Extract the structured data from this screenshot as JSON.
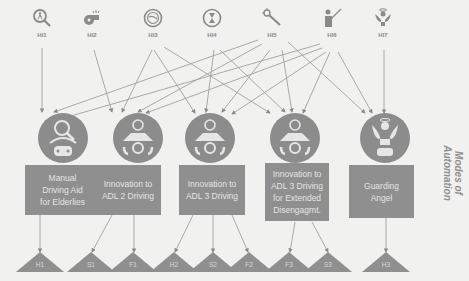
{
  "colors": {
    "background": "#f1f1ef",
    "node_fill": "#8c8c8c",
    "box_fill": "#8f8f8f",
    "box_text": "#e4e4e4",
    "line": "#9a9a9a",
    "label": "#8a8a8a"
  },
  "human_inputs": [
    {
      "id": "HI1",
      "label": "HI1",
      "icon": "magnifier-person-icon"
    },
    {
      "id": "HI2",
      "label": "HI2",
      "icon": "whistle-icon"
    },
    {
      "id": "HI3",
      "label": "HI3",
      "icon": "clock-face-icon"
    },
    {
      "id": "HI4",
      "label": "HI4",
      "icon": "hourglass-icon"
    },
    {
      "id": "HI5",
      "label": "HI5",
      "icon": "magic-wand-icon"
    },
    {
      "id": "HI6",
      "label": "HI6",
      "icon": "teacher-pointer-icon"
    },
    {
      "id": "HI7",
      "label": "HI7",
      "icon": "angel-icon"
    }
  ],
  "modes": [
    {
      "id": "M1",
      "label": "Manual Driving Aid for Elderlies",
      "lines": [
        "Manual",
        "Driving Aid",
        "for Elderlies"
      ],
      "icon": "magnifier-car-icon"
    },
    {
      "id": "M2",
      "label": "Innovation to ADL 2 Driving",
      "lines": [
        "Innovation to",
        "ADL 2 Driving"
      ],
      "icon": "clock-car-hands-icon"
    },
    {
      "id": "M3",
      "label": "Innovation to ADL 3 Driving",
      "lines": [
        "Innovation to",
        "ADL 3 Driving"
      ],
      "icon": "clock-car-hands-icon"
    },
    {
      "id": "M4",
      "label": "Innovation to ADL 3 Driving for Extended Disengagmt.",
      "lines": [
        "Innovation to",
        "ADL 3 Driving",
        "for Extended",
        "Disengagmt."
      ],
      "icon": "clock-car-hands-icon"
    },
    {
      "id": "M5",
      "label": "Guarding Angel",
      "lines": [
        "Guarding",
        "Angel"
      ],
      "icon": "angel-car-icon"
    }
  ],
  "outcomes": [
    {
      "id": "H1",
      "label": "H1",
      "from": "M1"
    },
    {
      "id": "S1",
      "label": "S1",
      "from": "M2"
    },
    {
      "id": "F1",
      "label": "F1",
      "from": "M2"
    },
    {
      "id": "H2",
      "label": "H2",
      "from": "M3"
    },
    {
      "id": "S2",
      "label": "S2",
      "from": "M3"
    },
    {
      "id": "F2",
      "label": "F2",
      "from": "M3"
    },
    {
      "id": "F3",
      "label": "F3",
      "from": "M4"
    },
    {
      "id": "S3",
      "label": "S3",
      "from": "M4"
    },
    {
      "id": "H3",
      "label": "H3",
      "from": "M5"
    }
  ],
  "edges_inputs_to_modes": [
    [
      "HI1",
      "M1"
    ],
    [
      "HI2",
      "M2"
    ],
    [
      "HI3",
      "M2"
    ],
    [
      "HI3",
      "M3"
    ],
    [
      "HI3",
      "M4"
    ],
    [
      "HI4",
      "M3"
    ],
    [
      "HI4",
      "M4"
    ],
    [
      "HI5",
      "M1"
    ],
    [
      "HI5",
      "M2"
    ],
    [
      "HI5",
      "M3"
    ],
    [
      "HI5",
      "M4"
    ],
    [
      "HI5",
      "M5"
    ],
    [
      "HI6",
      "M1"
    ],
    [
      "HI6",
      "M2"
    ],
    [
      "HI6",
      "M3"
    ],
    [
      "HI6",
      "M4"
    ],
    [
      "HI6",
      "M5"
    ],
    [
      "HI7",
      "M5"
    ]
  ],
  "side_title": {
    "line1": "Modes of",
    "line2": "Automation"
  }
}
